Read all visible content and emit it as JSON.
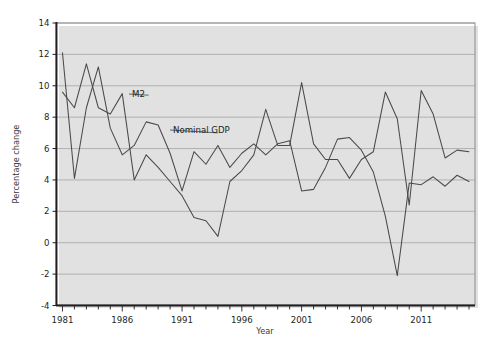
{
  "figure": {
    "name": "m2-and-nominal-gdp-growth-chart",
    "background_color": "#ffffff",
    "line_color": "#4a4a4a",
    "grid_color": "#8c9196"
  },
  "chart_data": {
    "type": "line",
    "title": "",
    "xlabel": "Year",
    "ylabel": "Percentage change",
    "xlim": [
      1980.5,
      2015.5
    ],
    "ylim": [
      -4,
      14
    ],
    "ytick_values": [
      -4,
      -2,
      0,
      2,
      4,
      6,
      8,
      10,
      12,
      14
    ],
    "ytick_labels": [
      "-4",
      "-2",
      "0",
      "2",
      "4",
      "6",
      "8",
      "10",
      "12",
      "14"
    ],
    "xtick_labels": [
      "1981",
      "1986",
      "1991",
      "1996",
      "2001",
      "2006",
      "2011"
    ],
    "xtick_values": [
      1981,
      1986,
      1991,
      1996,
      2001,
      2006,
      2011
    ],
    "xtick_minor_step": 1,
    "grid": "horizontal",
    "legend_position": "inline-annotations",
    "x": [
      1981,
      1982,
      1983,
      1984,
      1985,
      1986,
      1987,
      1988,
      1989,
      1990,
      1991,
      1992,
      1993,
      1994,
      1995,
      1996,
      1997,
      1998,
      1999,
      2000,
      2001,
      2002,
      2003,
      2004,
      2005,
      2006,
      2007,
      2008,
      2009,
      2010,
      2011,
      2012,
      2013,
      2014,
      2015
    ],
    "series": [
      {
        "name": "M2",
        "label": "M2",
        "values": [
          9.6,
          8.6,
          11.4,
          8.6,
          8.2,
          9.5,
          4.0,
          5.6,
          4.8,
          3.9,
          3.0,
          1.6,
          1.4,
          0.4,
          3.9,
          4.6,
          5.6,
          8.5,
          6.2,
          6.2,
          10.2,
          6.3,
          5.3,
          5.3,
          4.1,
          5.3,
          5.8,
          9.6,
          7.9,
          2.4,
          9.7,
          8.2,
          5.4,
          5.9,
          5.8
        ],
        "annotation": {
          "text": "M2",
          "x": 1988.2,
          "y": 9.4
        }
      },
      {
        "name": "Nominal GDP",
        "label": "Nominal GDP",
        "values": [
          12.1,
          4.1,
          8.6,
          11.2,
          7.3,
          5.6,
          6.2,
          7.7,
          7.5,
          5.7,
          3.3,
          5.8,
          5.0,
          6.2,
          4.8,
          5.7,
          6.3,
          5.6,
          6.3,
          6.5,
          3.3,
          3.4,
          4.8,
          6.6,
          6.7,
          5.9,
          4.5,
          1.7,
          -2.1,
          3.8,
          3.7,
          4.2,
          3.6,
          4.3,
          3.9
        ],
        "annotation": {
          "text": "Nominal GDP",
          "x": 1994.0,
          "y": 7.0
        }
      }
    ]
  }
}
